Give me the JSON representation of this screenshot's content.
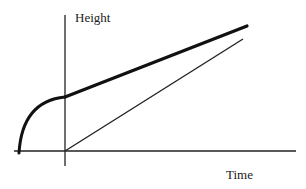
{
  "diagram": {
    "y_axis_label": "Height",
    "x_axis_label": "Time",
    "curves": [
      {
        "name": "thick-curve",
        "description": "rises steeply from before t=0 (concave), then continues as a straight line with gentle slope"
      },
      {
        "name": "thin-line",
        "description": "straight line starting at origin with steeper slope than thick line"
      }
    ],
    "colors": {
      "stroke": "#111111",
      "background": "#ffffff"
    }
  }
}
